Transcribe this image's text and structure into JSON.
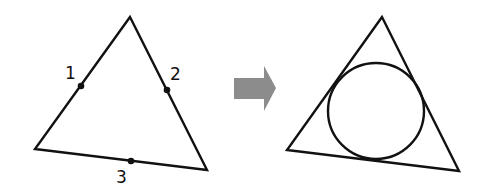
{
  "diagram": {
    "left_figure": {
      "shape": "triangle",
      "vertices": [
        [
          130,
          17
        ],
        [
          35,
          149
        ],
        [
          207,
          170
        ]
      ],
      "points": [
        {
          "label": "1",
          "x": 81,
          "y": 86,
          "label_x": 67,
          "label_y": 78
        },
        {
          "label": "2",
          "x": 167,
          "y": 90,
          "label_x": 171,
          "label_y": 81
        },
        {
          "label": "3",
          "x": 131,
          "y": 161,
          "label_x": 118,
          "label_y": 183
        }
      ]
    },
    "arrow": {
      "color": "#8c8c8c",
      "direction": "right"
    },
    "right_figure": {
      "shape": "triangle-with-inscribed-circle",
      "vertices": [
        [
          382,
          17
        ],
        [
          287,
          150
        ],
        [
          459,
          171
        ]
      ],
      "circle": {
        "cx": 376,
        "cy": 111,
        "r": 48
      }
    },
    "colors": {
      "stroke": "#111111",
      "arrow": "#8c8c8c",
      "background": "#ffffff"
    }
  }
}
